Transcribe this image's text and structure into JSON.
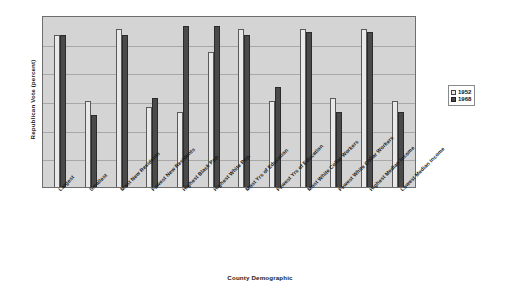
{
  "chart_data": {
    "type": "bar",
    "title": "",
    "xlabel": "County Demographic",
    "ylabel": "Republican Vote (percent)",
    "ylim": [
      0,
      60
    ],
    "grid": true,
    "legend_position": "right",
    "gridline_values": [
      10,
      20,
      30,
      40,
      50,
      60
    ],
    "categories": [
      "Largest",
      "Smallest",
      "Most New Residents",
      "Fewest New Residents",
      "Highest Black Pop.",
      "Highest White Pop.",
      "Most Yrs of Education",
      "Fewest Yrs of Education",
      "Most White Collar Workers",
      "Fewest White Collar Workers",
      "Highest Median Income",
      "Lowest Median Income"
    ],
    "series": [
      {
        "name": "1952",
        "color": "#e9e9e9",
        "values": [
          53,
          30,
          55,
          28,
          26,
          47,
          55,
          30,
          55,
          31,
          55,
          30
        ]
      },
      {
        "name": "1968",
        "color": "#4a4a4a",
        "values": [
          53,
          25,
          53,
          31,
          56,
          56,
          53,
          35,
          54,
          26,
          54,
          26
        ]
      }
    ]
  },
  "legend": {
    "items": [
      {
        "label": "1952",
        "swatch": "light-square-icon"
      },
      {
        "label": "1968",
        "swatch": "dark-square-icon"
      }
    ]
  }
}
